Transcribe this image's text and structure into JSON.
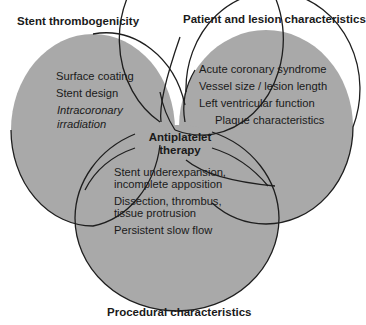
{
  "diagram": {
    "type": "venn",
    "fill_color": "#a9a9a9",
    "stroke_color": "#1e1e1e",
    "center_label_line1": "Antiplatelet",
    "center_label_line2": "therapy",
    "sets": [
      {
        "title": "Stent thrombogenicity",
        "items": [
          "Surface coating",
          "Stent design"
        ],
        "italic_items": [
          "Intracoronary",
          "irradiation"
        ]
      },
      {
        "title": "Patient and lesion characteristics",
        "items": [
          "Acute coronary syndrome",
          "Vessel size / lesion length",
          "Left ventricular function",
          "Plaque characteristics"
        ]
      },
      {
        "title": "Procedural characteristics",
        "items": [
          "Stent underexpansion,",
          "incomplete apposition",
          "Dissection, thrombus,",
          "tissue protrusion",
          "Persistent slow flow"
        ]
      }
    ]
  }
}
